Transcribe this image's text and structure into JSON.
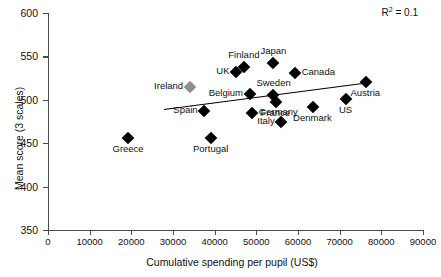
{
  "chart_data": {
    "type": "scatter",
    "title": "",
    "xlabel": "Cumulative spending per pupil (US$)",
    "ylabel": "Mean score (3 scales)",
    "xlim": [
      0,
      90000
    ],
    "ylim": [
      350,
      600
    ],
    "xticks": [
      0,
      10000,
      20000,
      30000,
      40000,
      50000,
      60000,
      70000,
      80000,
      90000
    ],
    "yticks": [
      350,
      400,
      450,
      500,
      550,
      600
    ],
    "xtick_labels": [
      "0",
      "10000",
      "20000",
      "30000",
      "40000",
      "50000",
      "60000",
      "70000",
      "80000",
      "90000"
    ],
    "ytick_labels": [
      "350",
      "400",
      "450",
      "500",
      "550",
      "600"
    ],
    "grid": false,
    "legend": null,
    "annotations": [
      {
        "name": "r2-annotation",
        "text_prefix": "R",
        "text_sup": "2",
        "text_suffix": " = 0.1"
      }
    ],
    "trendline": {
      "x_start": 27800,
      "y_start": 490,
      "x_end": 77200,
      "y_end": 521,
      "color": "#000000"
    },
    "points": [
      {
        "label": "Greece",
        "x": 19200,
        "y": 456,
        "color": "#000000",
        "label_pos": "below"
      },
      {
        "label": "Ireland",
        "x": 34100,
        "y": 515,
        "color": "#8f8f8f",
        "label_pos": "left"
      },
      {
        "label": "Spain",
        "x": 37500,
        "y": 487,
        "color": "#000000",
        "label_pos": "left"
      },
      {
        "label": "Portugal",
        "x": 39000,
        "y": 456,
        "color": "#000000",
        "label_pos": "below"
      },
      {
        "label": "UK",
        "x": 45200,
        "y": 532,
        "color": "#000000",
        "label_pos": "left"
      },
      {
        "label": "Finland",
        "x": 47000,
        "y": 538,
        "color": "#000000",
        "label_pos": "above"
      },
      {
        "label": "Belgium",
        "x": 48400,
        "y": 507,
        "color": "#000000",
        "label_pos": "left"
      },
      {
        "label": "Germany",
        "x": 48900,
        "y": 485,
        "color": "#000000",
        "label_pos": "right"
      },
      {
        "label": "Japan",
        "x": 54100,
        "y": 542,
        "color": "#000000",
        "label_pos": "above"
      },
      {
        "label": "Sweden",
        "x": 54100,
        "y": 506,
        "color": "#000000",
        "label_pos": "above"
      },
      {
        "label": "France",
        "x": 54600,
        "y": 498,
        "color": "#000000",
        "label_pos": "below"
      },
      {
        "label": "Italy",
        "x": 56000,
        "y": 475,
        "color": "#000000",
        "label_pos": "left"
      },
      {
        "label": "Canada",
        "x": 59200,
        "y": 531,
        "color": "#000000",
        "label_pos": "right"
      },
      {
        "label": "Denmark",
        "x": 63500,
        "y": 492,
        "color": "#000000",
        "label_pos": "below"
      },
      {
        "label": "US",
        "x": 71400,
        "y": 501,
        "color": "#000000",
        "label_pos": "below"
      },
      {
        "label": "Austria",
        "x": 76200,
        "y": 520,
        "color": "#000000",
        "label_pos": "below"
      }
    ]
  }
}
